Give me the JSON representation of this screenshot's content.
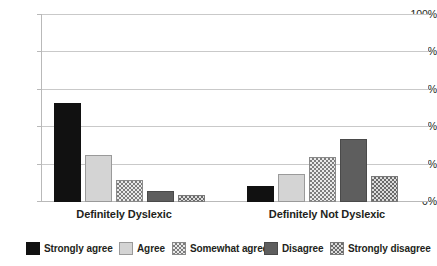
{
  "chart_data": {
    "type": "bar",
    "title": "",
    "subtitle": "",
    "xlabel": "",
    "ylabel": "",
    "categories": [
      "Definitely Dyslexic",
      "Definitely Not Dyslexic"
    ],
    "series": [
      {
        "name": "Strongly agree",
        "values": [
          53.0,
          8.5
        ],
        "fill": "solid-black",
        "color": "#111111"
      },
      {
        "name": "Agree",
        "values": [
          25.0,
          15.0
        ],
        "fill": "solid-lightgray",
        "color": "#d4d4d4"
      },
      {
        "name": "Somewhat agree",
        "values": [
          11.5,
          24.0
        ],
        "fill": "check-light",
        "color": "#e9e9e9"
      },
      {
        "name": "Disagree",
        "values": [
          6.0,
          33.5
        ],
        "fill": "solid-darkgray",
        "color": "#5e5e5e"
      },
      {
        "name": "Strongly disagree",
        "values": [
          3.7,
          13.8
        ],
        "fill": "check-mid",
        "color": "#dcdcdc"
      }
    ],
    "ylim": [
      0,
      100
    ],
    "yticks": [
      0,
      20,
      40,
      60,
      80,
      100
    ],
    "ytick_labels": [
      "0%",
      "20%",
      "40%",
      "60%",
      "80%",
      "100%"
    ],
    "grid": true,
    "legend_position": "bottom",
    "legend_entries": [
      "Strongly agree",
      "Agree",
      "Somewhat agree",
      "Disagree",
      "Strongly disagree"
    ]
  },
  "axis": {
    "y_labels": [
      "100%",
      "80%",
      "60%",
      "40%",
      "20%",
      "0%"
    ],
    "x_labels": [
      "Definitely Dyslexic",
      "Definitely Not Dyslexic"
    ]
  },
  "legend": {
    "items": [
      {
        "label": "Strongly agree"
      },
      {
        "label": "Agree"
      },
      {
        "label": "Somewhat agree"
      },
      {
        "label": "Disagree"
      },
      {
        "label": "Strongly disagree"
      }
    ]
  }
}
